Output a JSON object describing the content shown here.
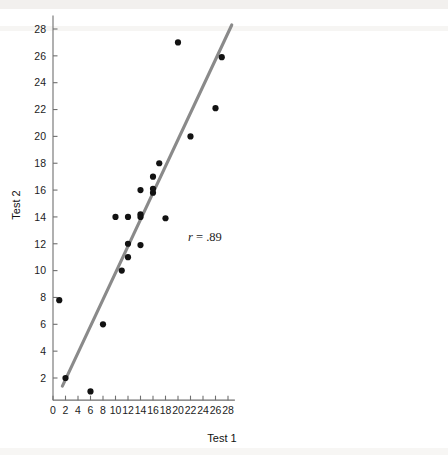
{
  "chart_data": {
    "type": "scatter",
    "title": "",
    "xlabel": "Test 1",
    "ylabel": "Test 2",
    "xlim": [
      0,
      29.2
    ],
    "ylim": [
      0,
      29.2
    ],
    "grid": false,
    "legend": null,
    "xticks": [
      0,
      2,
      4,
      6,
      8,
      10,
      12,
      14,
      16,
      18,
      20,
      22,
      24,
      26,
      28
    ],
    "xtick_labels": [
      "0",
      "2",
      "4",
      "6",
      "8",
      "10",
      "12",
      "14",
      "16",
      "18",
      "20",
      "22",
      "24",
      "26",
      "28"
    ],
    "yticks": [
      2,
      4,
      6,
      8,
      10,
      12,
      14,
      16,
      18,
      20,
      22,
      24,
      26,
      28
    ],
    "ytick_labels": [
      "2",
      "4",
      "6",
      "8",
      "10",
      "12",
      "14",
      "16",
      "18",
      "20",
      "22",
      "24",
      "26",
      "28"
    ],
    "point_color": "#121212",
    "point_radius": 3.1,
    "points": [
      {
        "x": 1,
        "y": 7.8
      },
      {
        "x": 2,
        "y": 2.0
      },
      {
        "x": 6,
        "y": 1.0
      },
      {
        "x": 8,
        "y": 6.0
      },
      {
        "x": 10,
        "y": 14.0
      },
      {
        "x": 11,
        "y": 10.0
      },
      {
        "x": 12,
        "y": 11.0
      },
      {
        "x": 12,
        "y": 12.0
      },
      {
        "x": 12,
        "y": 14.0
      },
      {
        "x": 14,
        "y": 11.9
      },
      {
        "x": 14,
        "y": 14.0
      },
      {
        "x": 14,
        "y": 14.2
      },
      {
        "x": 14,
        "y": 16.0
      },
      {
        "x": 16,
        "y": 15.8
      },
      {
        "x": 16,
        "y": 16.1
      },
      {
        "x": 16,
        "y": 17.0
      },
      {
        "x": 17,
        "y": 18.0
      },
      {
        "x": 18,
        "y": 13.9
      },
      {
        "x": 20,
        "y": 27.0
      },
      {
        "x": 22,
        "y": 20.0
      },
      {
        "x": 26,
        "y": 22.1
      },
      {
        "x": 27,
        "y": 25.9
      }
    ],
    "fit_line": {
      "color": "#8a8a8a",
      "width": 3.1,
      "x_start": 1.5,
      "y_start": 1.4,
      "x_end": 28.6,
      "y_end": 28.3
    },
    "annotations": [
      {
        "name": "correlation-annotation",
        "symbol": "r",
        "text": " = .89",
        "full_text": "r = .89",
        "x": 21.6,
        "y": 12.2
      }
    ]
  },
  "axes": {
    "x_title": "Test 1",
    "y_title": "Test 2"
  }
}
